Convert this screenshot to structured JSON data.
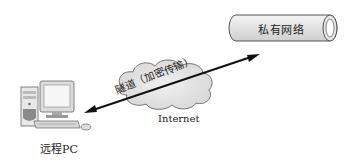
{
  "diagram": {
    "type": "network-topology",
    "nodes": {
      "private_network": {
        "label": "私有网络",
        "shape": "pipe"
      },
      "internet": {
        "label": "Internet",
        "shape": "cloud"
      },
      "remote_pc": {
        "label": "远程PC",
        "shape": "computer"
      }
    },
    "edges": [
      {
        "from": "remote_pc",
        "to": "private_network",
        "label": "隧道（加密传输）",
        "direction": "bidirectional",
        "via": "internet"
      }
    ],
    "colors": {
      "line": "#111111",
      "cloud_fill": "#e4e4e4",
      "pipe_fill": "#e8e8e8",
      "stroke": "#555555"
    }
  }
}
